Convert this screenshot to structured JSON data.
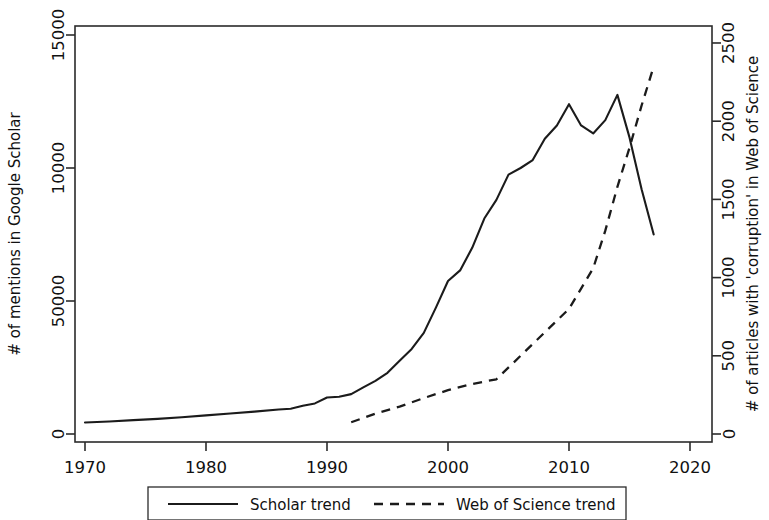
{
  "chart_data": {
    "type": "line",
    "title": "",
    "subtitle": "",
    "grid": false,
    "legend_position": "bottom",
    "xlabel": "",
    "xlim": [
      1967,
      2022
    ],
    "x_ticks": [
      1970,
      1980,
      1990,
      2000,
      2010,
      2020
    ],
    "x_tick_labels": [
      "1970",
      "1980",
      "1990",
      "2000",
      "2010",
      "2020"
    ],
    "axes": [
      {
        "id": "left",
        "ylabel": "# of mentions in Google Scholar",
        "ylim": [
          0,
          15500
        ],
        "y_ticks": [
          0,
          5000,
          10000,
          15000
        ],
        "y_tick_labels": [
          "0",
          "50000",
          "10000",
          "15000"
        ]
      },
      {
        "id": "right",
        "ylabel": "# of articles with 'corruption' in Web of Science",
        "ylim": [
          0,
          2583
        ],
        "y_ticks": [
          0,
          500,
          1000,
          1500,
          2000,
          2500
        ],
        "y_tick_labels": [
          "0",
          "500",
          "1000",
          "1500",
          "2000",
          "2500"
        ]
      }
    ],
    "series": [
      {
        "name": "Scholar trend",
        "axis": "left",
        "style": "solid",
        "color": "#1b1b1b",
        "x": [
          1970,
          1972,
          1974,
          1976,
          1978,
          1980,
          1982,
          1984,
          1986,
          1987,
          1988,
          1989,
          1990,
          1991,
          1992,
          1993,
          1994,
          1995,
          1996,
          1997,
          1998,
          1999,
          2000,
          2001,
          2002,
          2003,
          2004,
          2005,
          2006,
          2007,
          2008,
          2009,
          2010,
          2011,
          2012,
          2013,
          2014,
          2015,
          2016,
          2017
        ],
        "values": [
          430,
          470,
          520,
          570,
          630,
          700,
          770,
          840,
          920,
          950,
          1060,
          1150,
          1370,
          1400,
          1500,
          1750,
          2000,
          2300,
          2750,
          3200,
          3800,
          4750,
          5750,
          6150,
          7000,
          8100,
          8800,
          9750,
          10000,
          10300,
          11100,
          11600,
          12400,
          11600,
          11300,
          11800,
          12750,
          11150,
          9200,
          7500
        ]
      },
      {
        "name": "Web of Science trend",
        "axis": "right",
        "style": "dashed",
        "color": "#1b1b1b",
        "x": [
          1992,
          1994,
          1996,
          1998,
          2000,
          2002,
          2004,
          2006,
          2008,
          2010,
          2011,
          2012,
          2013,
          2014,
          2015,
          2016,
          2017
        ],
        "values": [
          75,
          130,
          175,
          230,
          280,
          320,
          350,
          500,
          650,
          800,
          930,
          1060,
          1300,
          1580,
          1830,
          2100,
          2350
        ]
      }
    ],
    "legend": [
      {
        "label": "Scholar trend",
        "style": "solid"
      },
      {
        "label": "Web of Science trend",
        "style": "dashed"
      }
    ]
  }
}
